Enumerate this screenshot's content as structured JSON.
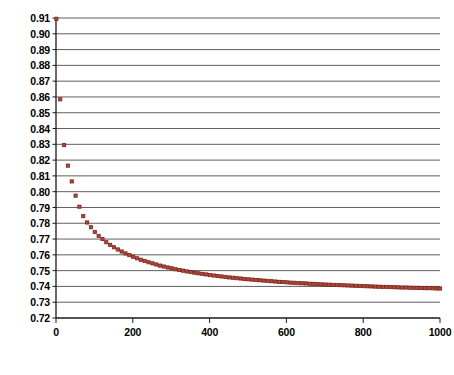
{
  "chart_data": {
    "type": "scatter",
    "title": "",
    "subtitle": "",
    "xlabel": "",
    "ylabel": "",
    "xlim": [
      0,
      1000
    ],
    "ylim": [
      0.72,
      0.91
    ],
    "grid": true,
    "grid_axis": "y",
    "legend": false,
    "legend_position": "none",
    "marker": {
      "shape": "square",
      "size": 3.2,
      "fill_color": "#b4483a",
      "edge_color": "#7d2118"
    },
    "axis_color": "#1a1a1a",
    "gridline_color": "#4d4d4d",
    "plot_background": "#ffffff",
    "ytick_labels": [
      "0.91",
      "0.90",
      "0.89",
      "0.88",
      "0.87",
      "0.86",
      "0.85",
      "0.84",
      "0.83",
      "0.82",
      "0.81",
      "0.80",
      "0.79",
      "0.78",
      "0.77",
      "0.76",
      "0.75",
      "0.74",
      "0.73",
      "0.72"
    ],
    "ytick_values": [
      0.91,
      0.9,
      0.89,
      0.88,
      0.87,
      0.86,
      0.85,
      0.84,
      0.83,
      0.82,
      0.81,
      0.8,
      0.79,
      0.78,
      0.77,
      0.76,
      0.75,
      0.74,
      0.73,
      0.72
    ],
    "xtick_labels": [
      "0",
      "200",
      "400",
      "600",
      "800",
      "1000"
    ],
    "xtick_values": [
      0,
      200,
      400,
      600,
      800,
      1000
    ],
    "x": [
      1,
      11,
      21,
      31,
      41,
      51,
      61,
      71,
      81,
      91,
      101,
      111,
      121,
      131,
      141,
      151,
      161,
      171,
      181,
      191,
      201,
      211,
      221,
      231,
      241,
      251,
      261,
      271,
      281,
      291,
      301,
      311,
      321,
      331,
      341,
      351,
      361,
      371,
      381,
      391,
      401,
      411,
      421,
      431,
      441,
      451,
      461,
      471,
      481,
      491,
      501,
      511,
      521,
      531,
      541,
      551,
      561,
      571,
      581,
      591,
      601,
      611,
      621,
      631,
      641,
      651,
      661,
      671,
      681,
      691,
      701,
      711,
      721,
      731,
      741,
      751,
      761,
      771,
      781,
      791,
      801,
      811,
      821,
      831,
      841,
      851,
      861,
      871,
      881,
      891,
      901,
      911,
      921,
      931,
      941,
      951,
      961,
      971,
      981,
      991,
      1000
    ],
    "y": [
      0.9095,
      0.8585,
      0.8295,
      0.8165,
      0.8065,
      0.7975,
      0.7905,
      0.7845,
      0.7805,
      0.7775,
      0.7745,
      0.772,
      0.77,
      0.768,
      0.7663,
      0.7648,
      0.7634,
      0.7621,
      0.7609,
      0.7598,
      0.7588,
      0.7578,
      0.7569,
      0.7561,
      0.7553,
      0.7546,
      0.7539,
      0.7532,
      0.7526,
      0.752,
      0.7515,
      0.7509,
      0.7504,
      0.75,
      0.7495,
      0.7491,
      0.7487,
      0.7483,
      0.7479,
      0.7476,
      0.7472,
      0.7469,
      0.7466,
      0.7463,
      0.746,
      0.7457,
      0.7455,
      0.7452,
      0.745,
      0.7447,
      0.7445,
      0.7443,
      0.7441,
      0.7439,
      0.7437,
      0.7435,
      0.7433,
      0.7431,
      0.7429,
      0.7428,
      0.7426,
      0.7424,
      0.7423,
      0.7421,
      0.742,
      0.7419,
      0.7417,
      0.7416,
      0.7415,
      0.7413,
      0.7412,
      0.7411,
      0.741,
      0.7409,
      0.7408,
      0.7407,
      0.7406,
      0.7405,
      0.7404,
      0.7403,
      0.7402,
      0.7401,
      0.74,
      0.7399,
      0.7398,
      0.7397,
      0.7397,
      0.7396,
      0.7395,
      0.7394,
      0.7393,
      0.7393,
      0.7392,
      0.7391,
      0.7391,
      0.739,
      0.7389,
      0.7389,
      0.7388,
      0.7387,
      0.7387
    ]
  }
}
